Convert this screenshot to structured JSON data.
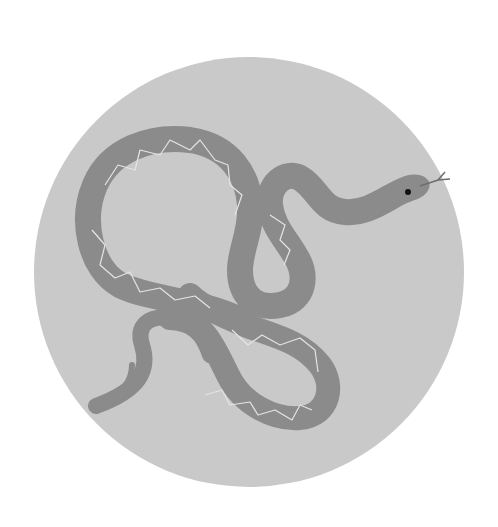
{
  "illustration": {
    "subject": "snake",
    "background_circle": {
      "cx": 249,
      "cy": 272,
      "r": 215,
      "color": "#c9c9c9"
    },
    "snake_color": "#8b8b8b",
    "pattern_color": "#e4e4e4",
    "eye_color": "#111111",
    "tongue_color": "#6e6e6e"
  }
}
